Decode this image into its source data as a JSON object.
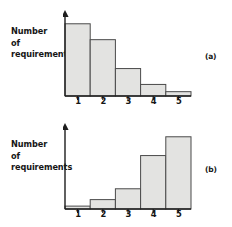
{
  "figure": {
    "axis_label_lines": [
      "Number",
      "of",
      "requirements"
    ],
    "panels": [
      {
        "tag": "(a)",
        "name": "panel-a"
      },
      {
        "tag": "(b)",
        "name": "panel-b"
      }
    ]
  },
  "chart_data": [
    {
      "type": "bar",
      "title": "(a)",
      "categories": [
        "1",
        "2",
        "3",
        "4",
        "5"
      ],
      "values": [
        100,
        78,
        38,
        16,
        6
      ],
      "xlabel": "",
      "ylabel": "Number of requirements",
      "ylim": [
        0,
        108
      ],
      "grid": false,
      "legend": "none",
      "bar_fill": "#e3e3e1",
      "bar_stroke": "#4a4a4a",
      "axis_color": "#1d1d1d",
      "note": "Descending histogram; bar heights read off pixel extents, axis unlabelled"
    },
    {
      "type": "bar",
      "title": "(b)",
      "categories": [
        "1",
        "2",
        "3",
        "4",
        "5"
      ],
      "values": [
        4,
        13,
        28,
        74,
        100
      ],
      "xlabel": "",
      "ylabel": "Number of requirements",
      "ylim": [
        0,
        108
      ],
      "grid": false,
      "legend": "none",
      "bar_fill": "#e3e3e1",
      "bar_stroke": "#4a4a4a",
      "axis_color": "#1d1d1d",
      "note": "Ascending histogram; bar heights read off pixel extents, axis unlabelled"
    }
  ]
}
